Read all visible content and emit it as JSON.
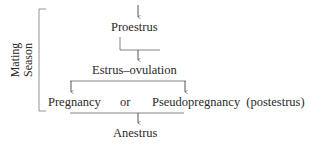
{
  "diagram": {
    "side_label": {
      "line1": "Mating",
      "line2": "Season"
    },
    "nodes": {
      "proestrus": "Proestrus",
      "estrus": "Estrus–ovulation",
      "pregnancy": "Pregnancy",
      "or": "or",
      "pseudopregnancy": "Pseudopregnancy (postestrus)",
      "anestrus": "Anestrus"
    },
    "colors": {
      "line": "#555555",
      "text": "#2a2a2a"
    }
  }
}
